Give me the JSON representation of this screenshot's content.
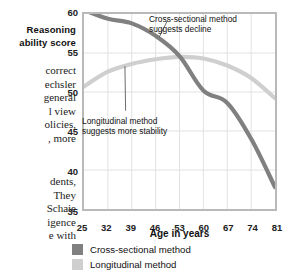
{
  "book_text": {
    "caption_heading": "Reasoning\nability score",
    "body_block_1": [
      "correct",
      "echsler",
      "general",
      "l view",
      "olicies,",
      ", more"
    ],
    "body_block_2": [
      "dents,",
      "They",
      "Schaie",
      "igence",
      "e with"
    ]
  },
  "chart_data": {
    "type": "line",
    "title": "",
    "xlabel": "Age in years",
    "ylabel": "Reasoning ability score",
    "x": [
      25,
      32,
      39,
      46,
      53,
      60,
      67,
      74,
      81
    ],
    "xlim": [
      25,
      81
    ],
    "ylim": [
      35,
      60
    ],
    "yticks": [
      35,
      40,
      45,
      50,
      55,
      60
    ],
    "xticks": [
      25,
      32,
      39,
      46,
      53,
      60,
      67,
      74,
      81
    ],
    "grid": true,
    "legend_position": "below",
    "series": [
      {
        "name": "Cross-sectional method",
        "color": "#808080",
        "values": [
          60.5,
          59.4,
          58.8,
          57.2,
          54.6,
          50.2,
          48.6,
          44.0,
          37.8
        ]
      },
      {
        "name": "Longitudinal method",
        "color": "#cfcfcf",
        "values": [
          50.7,
          52.6,
          53.6,
          54.2,
          54.5,
          54.3,
          53.4,
          51.8,
          49.2
        ]
      }
    ],
    "annotations": [
      {
        "id": "cross-sectional",
        "text": "Cross-sectional method\nsuggests decline",
        "points_to_x": 47,
        "points_to_y": 57.0
      },
      {
        "id": "longitudinal",
        "text": "Longitudinal method\nsuggests more stability",
        "points_to_x": 37,
        "points_to_y": 53.3
      }
    ]
  },
  "legend": [
    {
      "label": "Cross-sectional method",
      "color": "#808080"
    },
    {
      "label": "Longitudinal method",
      "color": "#cfcfcf"
    }
  ],
  "colors": {
    "frame": "#b9b9b9",
    "grid": "#e2e2e2",
    "cross_sectional": "#808080",
    "longitudinal": "#cfcfcf",
    "text": "#111111"
  }
}
